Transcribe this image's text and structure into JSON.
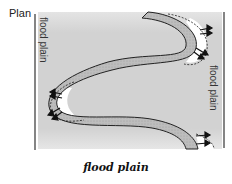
{
  "title": "Plan",
  "caption": "flood plain",
  "labels": {
    "left_flood_plain": "flood plain",
    "right_flood_plain": "flood plain"
  },
  "colors": {
    "flood_plain_fill": "#cfcfcf",
    "channel_fill": "#b8b8b8",
    "outline": "#222222",
    "background": "#ffffff"
  }
}
